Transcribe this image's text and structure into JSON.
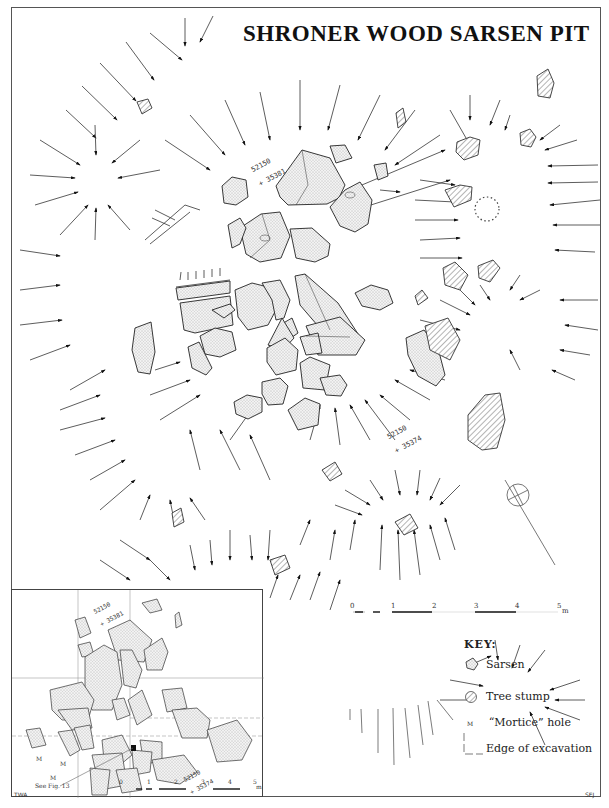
{
  "title": "SHRONER WOOD SARSEN PIT",
  "grid_refs": {
    "north": {
      "line1": "52150",
      "line2": "+ 35381"
    },
    "south": {
      "line1": "52150",
      "line2": "+ 35374"
    }
  },
  "main_scale": {
    "ticks": [
      "0",
      "1",
      "2",
      "3",
      "4",
      "5"
    ],
    "unit": "m"
  },
  "inset": {
    "grid_refs": {
      "north": {
        "line1": "52150",
        "line2": "+ 35381"
      },
      "south": {
        "line1": "52150",
        "line2": "+ 35374"
      }
    },
    "mortice_labels": [
      "M",
      "M",
      "M"
    ],
    "see_fig": "See Fig. 13",
    "scale": {
      "ticks": [
        "0",
        "1",
        "2",
        "3",
        "4",
        "5"
      ],
      "unit": "m"
    },
    "credit": "TWA"
  },
  "key": {
    "title": "KEY:",
    "items": [
      {
        "icon": "sarsen-icon",
        "label": "Sarsen"
      },
      {
        "icon": "tree-stump-icon",
        "label": "Tree stump"
      },
      {
        "icon": "mortice-hole-icon",
        "symbol": "M",
        "label": "“Mortice” hole"
      },
      {
        "icon": "excavation-edge-icon",
        "label": "Edge of excavation"
      }
    ]
  },
  "credits": {
    "left": "TWA",
    "right": "SEJ"
  },
  "colors": {
    "ink": "#111111",
    "stipple": "#d8d8d8",
    "hatch": "#555555",
    "frame": "#555555"
  }
}
